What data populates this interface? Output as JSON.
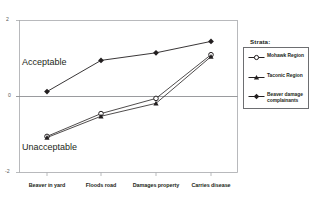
{
  "chart_data": {
    "type": "line",
    "title": "",
    "xlabel": "",
    "ylabel": "",
    "categories": [
      "Beaver in yard",
      "Floods road",
      "Damages property",
      "Carries disease"
    ],
    "ylim": [
      -2,
      2
    ],
    "yticks": [
      2,
      0,
      -2
    ],
    "ytick_labels": [
      "2",
      "0",
      "-2"
    ],
    "grid": false,
    "zero_reference_line": 0,
    "legend_position": "right",
    "annotations": [
      {
        "text": "Acceptable",
        "x_category": "Beaver in yard",
        "y": 1.0
      },
      {
        "text": "Unacceptable",
        "x_category": "Beaver in yard",
        "y": -1.25
      }
    ],
    "series": [
      {
        "name": "Mohawk Region",
        "marker": "open-circle",
        "values": [
          -1.05,
          -0.45,
          -0.05,
          1.1
        ]
      },
      {
        "name": "Taconic Region",
        "marker": "filled-triangle",
        "values": [
          -1.08,
          -0.52,
          -0.18,
          1.05
        ]
      },
      {
        "name": "Beaver damage complainants",
        "marker": "filled-diamond",
        "values": [
          0.13,
          0.95,
          1.15,
          1.45
        ]
      }
    ]
  },
  "legend": {
    "title": "Strata:",
    "entries": [
      {
        "label": "Mohawk Region",
        "marker": "open-circle"
      },
      {
        "label": "Taconic Region",
        "marker": "filled-triangle"
      },
      {
        "label": "Beaver damage complainants",
        "marker": "filled-diamond"
      }
    ]
  },
  "axes": {
    "y_tick_top": "2",
    "y_tick_middle": "0",
    "y_tick_bottom": "-2"
  },
  "colors": {
    "line": "#231f20",
    "frame": "#a7a9ac",
    "zero_line": "#808285",
    "background": "#ffffff"
  }
}
